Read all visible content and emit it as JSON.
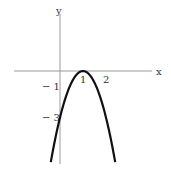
{
  "chart_data": {
    "type": "line",
    "title": "",
    "xlabel": "x",
    "ylabel": "y",
    "function": "y = -3(x - 1)^2",
    "xlim": [
      -0.8,
      3.5
    ],
    "ylim": [
      -6.0,
      4.1
    ],
    "x_ticks": [
      {
        "value": 1,
        "label": "1"
      },
      {
        "value": 2,
        "label": "2"
      }
    ],
    "y_ticks": [
      {
        "value": -1,
        "label": "-1"
      },
      {
        "value": -3,
        "label": "-3"
      }
    ],
    "series": [
      {
        "name": "parabola",
        "color": "#111111",
        "x": [
          -0.4,
          -0.2,
          0,
          0.2,
          0.4,
          0.6,
          0.8,
          1.0,
          1.2,
          1.4,
          1.6,
          1.8,
          2.0,
          2.2,
          2.4
        ],
        "y": [
          -5.88,
          -4.32,
          -3.0,
          -1.92,
          -1.08,
          -0.48,
          -0.12,
          0,
          -0.12,
          -0.48,
          -1.08,
          -1.92,
          -3.0,
          -4.32,
          -5.88
        ]
      }
    ],
    "grid": false,
    "legend": "none"
  }
}
